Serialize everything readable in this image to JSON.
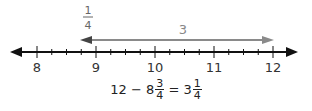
{
  "number_line": {
    "min": 8,
    "max": 12,
    "labels": [
      "8",
      "9",
      "10",
      "11",
      "12"
    ],
    "minor_ticks_per_unit": 4,
    "axis_color": "#111111",
    "jump_color": "#8a8a8a"
  },
  "jumps": [
    {
      "from": 8.75,
      "to": 9,
      "label_num": "1",
      "label_den": "4"
    },
    {
      "from": 9,
      "to": 12,
      "label": "3"
    }
  ],
  "equation": {
    "minuend": "12",
    "minus": "−",
    "subtrahend_whole": "8",
    "subtrahend_num": "3",
    "subtrahend_den": "4",
    "equals": "=",
    "result_whole": "3",
    "result_num": "1",
    "result_den": "4"
  }
}
